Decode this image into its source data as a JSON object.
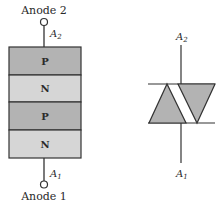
{
  "left_diagram": {
    "top_terminal_label": "Anode 2",
    "bottom_terminal_label": "Anode 1",
    "top_lead_label": {
      "main": "A",
      "sub": "2"
    },
    "bottom_lead_label": {
      "main": "A",
      "sub": "1"
    },
    "layers": [
      {
        "label": "P",
        "color": "#b3b3b3"
      },
      {
        "label": "N",
        "color": "#d6d6d6"
      },
      {
        "label": "P",
        "color": "#b3b3b3"
      },
      {
        "label": "N",
        "color": "#d6d6d6"
      }
    ]
  },
  "right_symbol": {
    "top_lead_label": {
      "main": "A",
      "sub": "2"
    },
    "bottom_lead_label": {
      "main": "A",
      "sub": "1"
    },
    "triangle_fill": "#b3b3b3"
  }
}
